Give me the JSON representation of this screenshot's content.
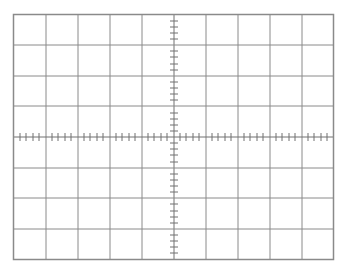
{
  "graticule": {
    "title": "Oscilloscope graticule",
    "left": 13.5,
    "top": 14.5,
    "width": 320,
    "height": 245,
    "major_divisions_x": 10,
    "major_divisions_y": 8,
    "minor_per_major": 5,
    "tick_half_length": 4,
    "line_color": "#8a8a8a",
    "axis_color": "#707070",
    "background": "#ffffff"
  }
}
